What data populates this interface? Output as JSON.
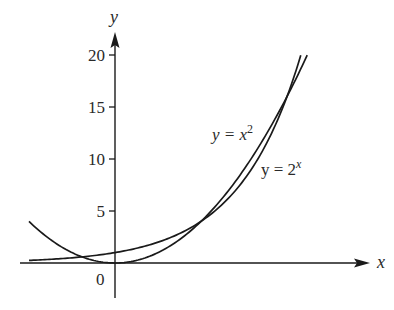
{
  "chart_data": {
    "type": "line",
    "title": "",
    "xlabel": "x",
    "ylabel": "y",
    "xlim": [
      -2.0,
      5.9
    ],
    "ylim": [
      -3.4,
      21.5
    ],
    "grid": false,
    "legend": "inline labels",
    "y_ticks": [
      5,
      10,
      15,
      20
    ],
    "y_tick_labels": [
      "5",
      "10",
      "15",
      "20"
    ],
    "origin_label": "0",
    "series": [
      {
        "name": "y = x^2",
        "label_text": "y = x",
        "label_sup": "2",
        "x": [
          -2,
          -1.5,
          -1,
          -0.5,
          0,
          0.5,
          1,
          1.5,
          2,
          2.5,
          3,
          3.5,
          4,
          4.47
        ],
        "values": [
          4,
          2.25,
          1,
          0.25,
          0,
          0.25,
          1,
          2.25,
          4,
          6.25,
          9,
          12.25,
          16,
          20
        ]
      },
      {
        "name": "y = 2^x",
        "label_text": "y = 2",
        "label_sup": "x",
        "x": [
          -2,
          -1.5,
          -1,
          -0.5,
          0,
          0.5,
          1,
          1.5,
          2,
          2.5,
          3,
          3.5,
          4,
          4.32
        ],
        "values": [
          0.25,
          0.35,
          0.5,
          0.71,
          1,
          1.41,
          2,
          2.83,
          4,
          5.66,
          8,
          11.31,
          16,
          20
        ]
      }
    ],
    "annotations": [
      "intersections at (2, 4) and (4, 16)"
    ]
  },
  "colors": {
    "ink": "#1a1a1a",
    "background": "#ffffff"
  }
}
